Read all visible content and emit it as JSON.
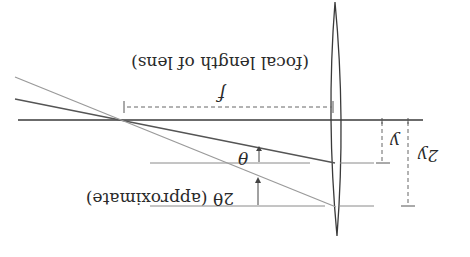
{
  "figure": {
    "orientation": "rotated-180",
    "colors": {
      "background": "#ffffff",
      "axis": "#3a3a3a",
      "ray_primary": "#555555",
      "ray_secondary": "#9a9a9a",
      "reference_line": "#8a8a8a",
      "dimension": "#666666",
      "text": "#2a2a2a"
    }
  },
  "labels": {
    "focal_length_symbol": "f",
    "focal_length_caption": "(focal length of lens)",
    "theta": "θ",
    "two_theta": "2θ (approximate)",
    "y": "y",
    "two_y": "2y"
  },
  "elements": {
    "optical_axis": "Optical axis",
    "lens": "Thin converging lens",
    "ray_y": "Ray entering at height y",
    "ray_2y": "Ray entering at height 2y",
    "focal_point": "Focal point"
  }
}
